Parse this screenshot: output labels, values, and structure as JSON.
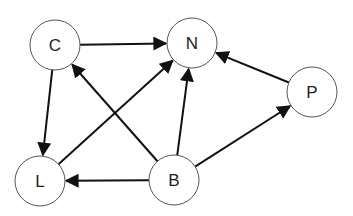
{
  "diagram": {
    "type": "directed-graph",
    "nodes": [
      {
        "id": "C",
        "label": "C",
        "x": 55,
        "y": 45
      },
      {
        "id": "N",
        "label": "N",
        "x": 192,
        "y": 43
      },
      {
        "id": "P",
        "label": "P",
        "x": 312,
        "y": 92
      },
      {
        "id": "L",
        "label": "L",
        "x": 40,
        "y": 181
      },
      {
        "id": "B",
        "label": "B",
        "x": 174,
        "y": 180
      }
    ],
    "edges": [
      {
        "from": "C",
        "to": "N"
      },
      {
        "from": "C",
        "to": "L"
      },
      {
        "from": "L",
        "to": "N"
      },
      {
        "from": "B",
        "to": "C"
      },
      {
        "from": "B",
        "to": "N"
      },
      {
        "from": "B",
        "to": "L"
      },
      {
        "from": "B",
        "to": "P"
      },
      {
        "from": "P",
        "to": "N"
      }
    ],
    "node_radius": 25,
    "colors": {
      "stroke": "#555555",
      "edge": "#111111",
      "fill": "#ffffff"
    }
  }
}
